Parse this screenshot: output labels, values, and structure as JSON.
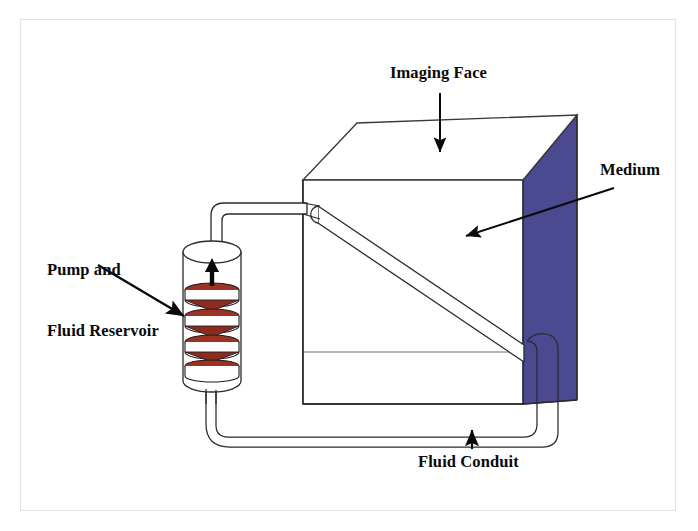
{
  "figure": {
    "background_color": "#ffffff",
    "frame_color": "#e3e3e6",
    "ink_color": "#0a0a0a",
    "medium_color": "#4b4a91",
    "pump_disc_color": "#9c3124",
    "pump_disc_shadow": "#6e2118",
    "pump_band_color": "#f2f2f2"
  },
  "labels": {
    "imaging_face": "Imaging Face",
    "medium": "Medium",
    "pump_and_reservoir_line1": "Pump and",
    "pump_and_reservoir_line2": "Fluid Reservoir",
    "fluid_conduit": "Fluid Conduit"
  },
  "parts": {
    "cube": "medium-cube",
    "imaging_face_panel": "cube-front-face",
    "medium_panels": "cube-side-panels",
    "pump": "pump-cylinder",
    "pump_flow_arrow": "upward-flow-arrow",
    "diagonal_tube": "internal-diagonal-conduit",
    "upper_tube": "upper-conduit",
    "lower_tube": "lower-return-conduit"
  },
  "annotations": [
    {
      "name": "imaging-face-pointer",
      "kind": "arrow",
      "direction": "down"
    },
    {
      "name": "medium-pointer",
      "kind": "arrow",
      "direction": "down-left"
    },
    {
      "name": "pump-pointer",
      "kind": "arrow",
      "direction": "down-right"
    },
    {
      "name": "fluid-conduit-pointer",
      "kind": "arrow",
      "direction": "up"
    }
  ]
}
